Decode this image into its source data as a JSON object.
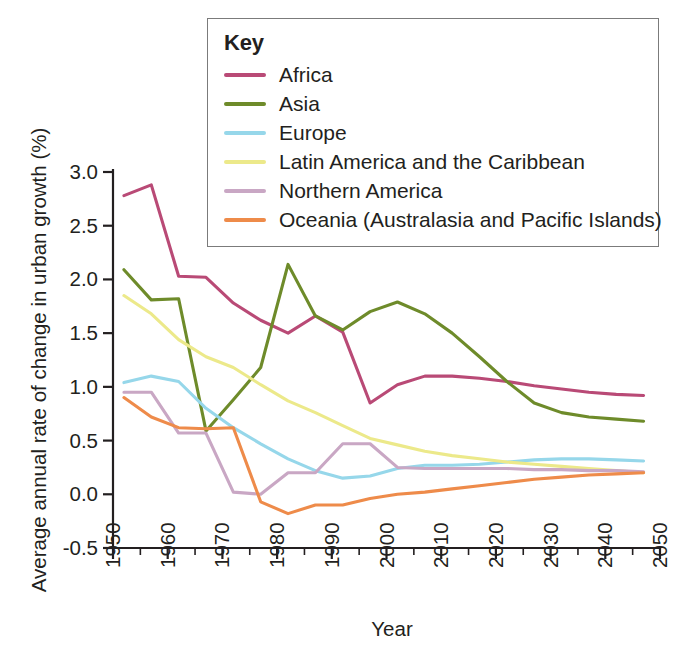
{
  "legend": {
    "title": "Key",
    "entries": [
      {
        "label": "Africa",
        "color": "#b94a76"
      },
      {
        "label": "Asia",
        "color": "#6e8b2a"
      },
      {
        "label": "Europe",
        "color": "#96d7ea"
      },
      {
        "label": "Latin America and the Caribbean",
        "color": "#ece98a"
      },
      {
        "label": "Northern America",
        "color": "#c9a7c4"
      },
      {
        "label": "Oceania (Australasia and Pacific Islands)",
        "color": "#ee8b4a"
      }
    ]
  },
  "chart_data": {
    "type": "line",
    "title": "",
    "xlabel": "Year",
    "ylabel": "Average annual rate of change in urban growth (%)",
    "xlim": [
      1950,
      2050
    ],
    "ylim": [
      -0.5,
      3.0
    ],
    "xticks": [
      1950,
      1960,
      1970,
      1980,
      1990,
      2000,
      2010,
      2020,
      2030,
      2040,
      2050
    ],
    "xtick_labels": [
      "1950",
      "1960",
      "1970",
      "1980",
      "1990",
      "2000",
      "2010",
      "2020",
      "2030",
      "2040",
      "2050"
    ],
    "xminor_step": 5,
    "yticks": [
      -0.5,
      0.0,
      0.5,
      1.0,
      1.5,
      2.0,
      2.5,
      3.0
    ],
    "ytick_labels": [
      "-0.5",
      "0.0",
      "0.5",
      "1.0",
      "1.5",
      "2.0",
      "2.5",
      "3.0"
    ],
    "grid": false,
    "legend_position": "top-right",
    "series": [
      {
        "name": "Africa",
        "color": "#b94a76",
        "x": [
          1952,
          1957,
          1962,
          1967,
          1972,
          1977,
          1982,
          1987,
          1992,
          1997,
          2002,
          2007,
          2012,
          2017,
          2022,
          2027,
          2032,
          2037,
          2042,
          2047
        ],
        "values": [
          2.78,
          2.88,
          2.03,
          2.02,
          1.78,
          1.62,
          1.5,
          1.66,
          1.51,
          0.85,
          1.02,
          1.1,
          1.1,
          1.08,
          1.05,
          1.01,
          0.98,
          0.95,
          0.93,
          0.92
        ]
      },
      {
        "name": "Asia",
        "color": "#6e8b2a",
        "x": [
          1952,
          1957,
          1962,
          1967,
          1972,
          1977,
          1982,
          1987,
          1992,
          1997,
          2002,
          2007,
          2012,
          2017,
          2022,
          2027,
          2032,
          2037,
          2042,
          2047
        ],
        "values": [
          2.09,
          1.81,
          1.82,
          0.59,
          0.88,
          1.18,
          2.14,
          1.66,
          1.53,
          1.7,
          1.79,
          1.68,
          1.5,
          1.28,
          1.05,
          0.85,
          0.76,
          0.72,
          0.7,
          0.68
        ]
      },
      {
        "name": "Europe",
        "color": "#96d7ea",
        "x": [
          1952,
          1957,
          1962,
          1967,
          1972,
          1977,
          1982,
          1987,
          1992,
          1997,
          2002,
          2007,
          2012,
          2017,
          2022,
          2027,
          2032,
          2037,
          2042,
          2047
        ],
        "values": [
          1.04,
          1.1,
          1.05,
          0.8,
          0.62,
          0.47,
          0.33,
          0.22,
          0.15,
          0.17,
          0.24,
          0.27,
          0.27,
          0.28,
          0.3,
          0.32,
          0.33,
          0.33,
          0.32,
          0.31
        ]
      },
      {
        "name": "Latin America and the Caribbean",
        "color": "#ece98a",
        "x": [
          1952,
          1957,
          1962,
          1967,
          1972,
          1977,
          1982,
          1987,
          1992,
          1997,
          2002,
          2007,
          2012,
          2017,
          2022,
          2027,
          2032,
          2037,
          2042,
          2047
        ],
        "values": [
          1.85,
          1.68,
          1.44,
          1.28,
          1.18,
          1.02,
          0.87,
          0.76,
          0.64,
          0.52,
          0.46,
          0.4,
          0.36,
          0.33,
          0.3,
          0.28,
          0.26,
          0.24,
          0.22,
          0.2
        ]
      },
      {
        "name": "Northern America",
        "color": "#c9a7c4",
        "x": [
          1952,
          1957,
          1962,
          1967,
          1972,
          1977,
          1982,
          1987,
          1992,
          1997,
          2002,
          2007,
          2012,
          2017,
          2022,
          2027,
          2032,
          2037,
          2042,
          2047
        ],
        "values": [
          0.95,
          0.95,
          0.57,
          0.57,
          0.02,
          0.0,
          0.2,
          0.2,
          0.47,
          0.47,
          0.25,
          0.24,
          0.24,
          0.24,
          0.24,
          0.23,
          0.23,
          0.22,
          0.22,
          0.21
        ]
      },
      {
        "name": "Oceania (Australasia and Pacific Islands)",
        "color": "#ee8b4a",
        "x": [
          1952,
          1957,
          1962,
          1967,
          1972,
          1977,
          1982,
          1987,
          1992,
          1997,
          2002,
          2007,
          2012,
          2017,
          2022,
          2027,
          2032,
          2037,
          2042,
          2047
        ],
        "values": [
          0.9,
          0.72,
          0.62,
          0.61,
          0.62,
          -0.07,
          -0.18,
          -0.1,
          -0.1,
          -0.04,
          0.0,
          0.02,
          0.05,
          0.08,
          0.11,
          0.14,
          0.16,
          0.18,
          0.19,
          0.2
        ]
      }
    ]
  }
}
